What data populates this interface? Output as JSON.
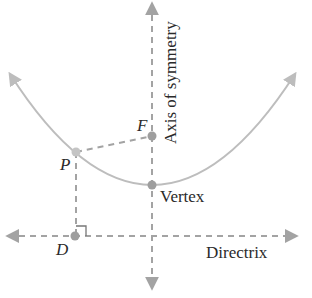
{
  "diagram": {
    "labels": {
      "axis": "Axis of symmetry",
      "focus": "F",
      "point": "P",
      "vertex": "Vertex",
      "directrix_point": "D",
      "directrix": "Directrix"
    },
    "colors": {
      "curve": "#bdbdbd",
      "dashed": "#a3a3a3",
      "point": "#9e9e9e",
      "text": "#2a2a2a"
    },
    "points": {
      "P": [
        76,
        152
      ],
      "F": [
        152,
        136
      ],
      "V": [
        152,
        185
      ],
      "D": [
        75,
        236
      ]
    }
  }
}
